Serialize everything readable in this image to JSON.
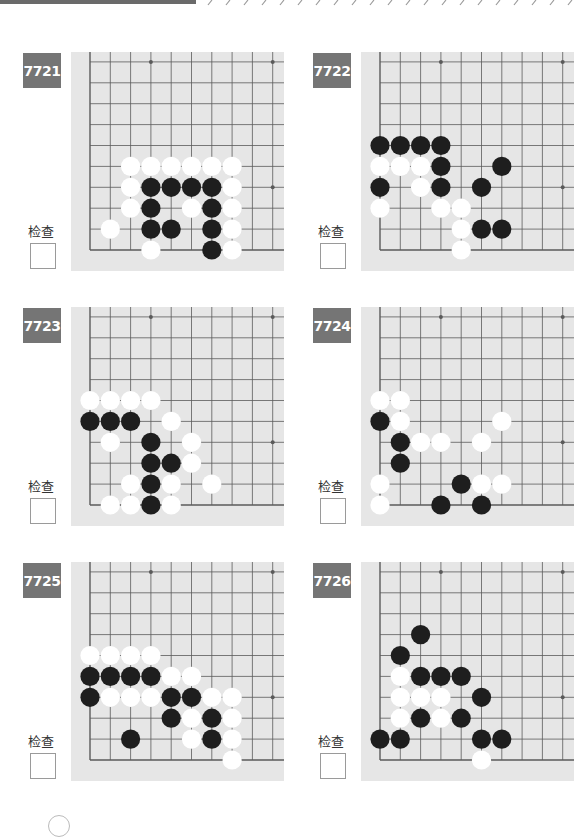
{
  "page": {
    "check_label": "检查"
  },
  "colors": {
    "label_bg": "#757575",
    "board_bg": "#e6e6e6",
    "grid_line": "#5a5a5a",
    "black_stone": "#1e1e1e",
    "white_stone": "#ffffff"
  },
  "problems": [
    {
      "id": "7721",
      "position": "left",
      "black": [
        [
          3,
          3
        ],
        [
          4,
          3
        ],
        [
          5,
          3
        ],
        [
          6,
          3
        ],
        [
          3,
          2
        ],
        [
          6,
          2
        ],
        [
          3,
          1
        ],
        [
          4,
          1
        ],
        [
          6,
          1
        ],
        [
          6,
          0
        ]
      ],
      "white": [
        [
          2,
          4
        ],
        [
          3,
          4
        ],
        [
          4,
          4
        ],
        [
          5,
          4
        ],
        [
          6,
          4
        ],
        [
          7,
          4
        ],
        [
          2,
          3
        ],
        [
          7,
          3
        ],
        [
          2,
          2
        ],
        [
          5,
          2
        ],
        [
          7,
          2
        ],
        [
          1,
          1
        ],
        [
          7,
          1
        ],
        [
          3,
          0
        ],
        [
          7,
          0
        ]
      ]
    },
    {
      "id": "7722",
      "position": "right",
      "black": [
        [
          0,
          5
        ],
        [
          1,
          5
        ],
        [
          2,
          5
        ],
        [
          3,
          5
        ],
        [
          3,
          4
        ],
        [
          6,
          4
        ],
        [
          0,
          3
        ],
        [
          3,
          3
        ],
        [
          5,
          3
        ],
        [
          5,
          1
        ],
        [
          6,
          1
        ]
      ],
      "white": [
        [
          0,
          4
        ],
        [
          1,
          4
        ],
        [
          2,
          4
        ],
        [
          2,
          3
        ],
        [
          0,
          2
        ],
        [
          3,
          2
        ],
        [
          4,
          2
        ],
        [
          4,
          1
        ],
        [
          4,
          0
        ]
      ]
    },
    {
      "id": "7723",
      "position": "left",
      "black": [
        [
          0,
          4
        ],
        [
          1,
          4
        ],
        [
          2,
          4
        ],
        [
          3,
          3
        ],
        [
          3,
          2
        ],
        [
          4,
          2
        ],
        [
          3,
          1
        ],
        [
          3,
          0
        ]
      ],
      "white": [
        [
          0,
          5
        ],
        [
          1,
          5
        ],
        [
          2,
          5
        ],
        [
          3,
          5
        ],
        [
          4,
          4
        ],
        [
          1,
          3
        ],
        [
          5,
          3
        ],
        [
          5,
          2
        ],
        [
          2,
          1
        ],
        [
          4,
          1
        ],
        [
          6,
          1
        ],
        [
          1,
          0
        ],
        [
          2,
          0
        ],
        [
          4,
          0
        ]
      ]
    },
    {
      "id": "7724",
      "position": "right",
      "black": [
        [
          0,
          4
        ],
        [
          1,
          3
        ],
        [
          1,
          2
        ],
        [
          4,
          1
        ],
        [
          3,
          0
        ],
        [
          5,
          0
        ]
      ],
      "white": [
        [
          0,
          5
        ],
        [
          1,
          5
        ],
        [
          1,
          4
        ],
        [
          6,
          4
        ],
        [
          2,
          3
        ],
        [
          3,
          3
        ],
        [
          5,
          3
        ],
        [
          0,
          1
        ],
        [
          5,
          1
        ],
        [
          6,
          1
        ],
        [
          0,
          0
        ]
      ]
    },
    {
      "id": "7725",
      "position": "left",
      "black": [
        [
          0,
          4
        ],
        [
          1,
          4
        ],
        [
          2,
          4
        ],
        [
          3,
          4
        ],
        [
          0,
          3
        ],
        [
          4,
          3
        ],
        [
          5,
          3
        ],
        [
          4,
          2
        ],
        [
          6,
          2
        ],
        [
          2,
          1
        ],
        [
          6,
          1
        ]
      ],
      "white": [
        [
          0,
          5
        ],
        [
          1,
          5
        ],
        [
          2,
          5
        ],
        [
          3,
          5
        ],
        [
          4,
          4
        ],
        [
          5,
          4
        ],
        [
          1,
          3
        ],
        [
          2,
          3
        ],
        [
          3,
          3
        ],
        [
          6,
          3
        ],
        [
          7,
          3
        ],
        [
          5,
          2
        ],
        [
          7,
          2
        ],
        [
          5,
          1
        ],
        [
          7,
          1
        ],
        [
          7,
          0
        ]
      ]
    },
    {
      "id": "7726",
      "position": "right",
      "black": [
        [
          2,
          6
        ],
        [
          1,
          5
        ],
        [
          2,
          4
        ],
        [
          3,
          4
        ],
        [
          4,
          4
        ],
        [
          5,
          3
        ],
        [
          2,
          2
        ],
        [
          4,
          2
        ],
        [
          0,
          1
        ],
        [
          1,
          1
        ],
        [
          5,
          1
        ],
        [
          6,
          1
        ]
      ],
      "white": [
        [
          1,
          4
        ],
        [
          1,
          3
        ],
        [
          2,
          3
        ],
        [
          3,
          3
        ],
        [
          1,
          2
        ],
        [
          3,
          2
        ],
        [
          5,
          0
        ]
      ]
    }
  ]
}
